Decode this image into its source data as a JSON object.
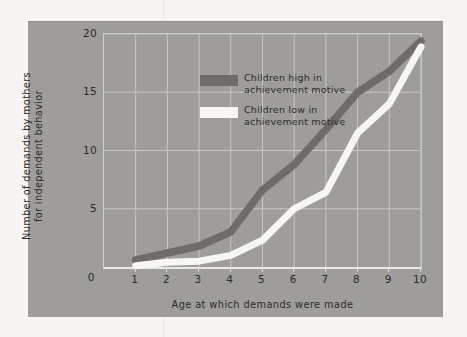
{
  "figure": {
    "page_bg": "#f6f5f2",
    "panel_bg": "#9e9d99",
    "gridline_color": "#c7c6c2",
    "text_color": "#2d2b28"
  },
  "chart_data": {
    "type": "line",
    "title": "",
    "xlabel": "Age at which demands were made",
    "ylabel": "Number of demands by mothers\nfor independent behavior",
    "xlim": [
      0,
      10
    ],
    "ylim": [
      0,
      20
    ],
    "xticks": [
      1,
      2,
      3,
      4,
      5,
      6,
      7,
      8,
      9,
      10
    ],
    "yticks": [
      5,
      10,
      15,
      20
    ],
    "origin_label": "0",
    "grid": true,
    "legend_position": "upper-left-inside",
    "x": [
      1,
      2,
      3,
      4,
      5,
      6,
      7,
      8,
      9,
      10
    ],
    "series": [
      {
        "name": "Children high in achievement motive",
        "color": "#6f6b68",
        "values": [
          0.6,
          1.2,
          1.8,
          3.0,
          6.6,
          8.8,
          11.8,
          15.0,
          16.8,
          19.4
        ]
      },
      {
        "name": "Children low in achievement motive",
        "color": "#f7f6f3",
        "values": [
          0.1,
          0.4,
          0.5,
          1.0,
          2.3,
          5.0,
          6.4,
          11.5,
          14.0,
          18.9
        ]
      }
    ]
  }
}
